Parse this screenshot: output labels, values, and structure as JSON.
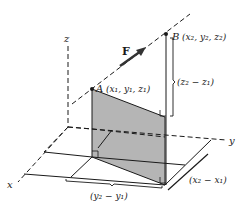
{
  "axes": {
    "x_label": "x",
    "y_label": "y",
    "z_label": "z"
  },
  "points": {
    "A": {
      "name": "A",
      "coords": "(x₁, y₁, z₁)"
    },
    "B": {
      "name": "B",
      "coords": "(x₂, y₂, z₂)"
    }
  },
  "vector": {
    "label": "F"
  },
  "differences": {
    "dz": "(z₂ − z₁)",
    "dx": "(x₂ − x₁)",
    "dy": "(y₂ − y₁)"
  },
  "colors": {
    "shade": "#b5b5b5",
    "line": "#1a1a1a"
  }
}
